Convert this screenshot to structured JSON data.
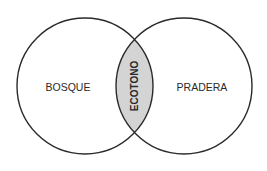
{
  "diagram": {
    "type": "venn",
    "sets": [
      {
        "label": "BOSQUE"
      },
      {
        "label": "PRADERA"
      }
    ],
    "intersection": {
      "label": "ECOTONO",
      "fill": "#d4d4d4"
    },
    "stroke_color": "#2a2a2a"
  }
}
